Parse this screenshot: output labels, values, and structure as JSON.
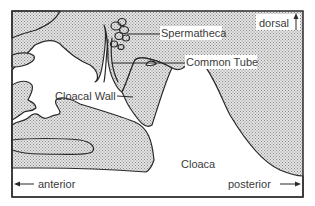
{
  "diagram": {
    "type": "anatomical cross-section",
    "labels": {
      "spermatheca": "Spermatheca",
      "common_tube": "Common Tube",
      "cloacal_wall": "Cloacal Wall",
      "cloaca": "Cloaca"
    },
    "orientation": {
      "dorsal": "dorsal",
      "anterior": "anterior",
      "posterior": "posterior"
    },
    "colors": {
      "outline": "#2a2a2a",
      "stipple": "#b8b8b8",
      "background": "#ffffff"
    }
  }
}
